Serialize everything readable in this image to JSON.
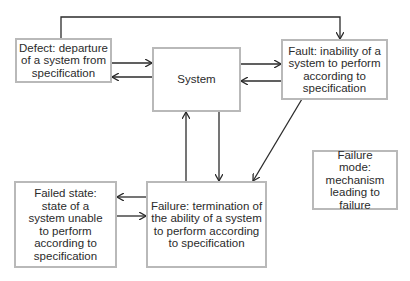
{
  "diagram": {
    "nodes": {
      "defect": {
        "label": "Defect: departure of a system from specification"
      },
      "system": {
        "label": "System"
      },
      "fault": {
        "label": "Fault: inability of a system to perform according to specification"
      },
      "failure": {
        "label": "Failure: termination of the ability of a system to perform according to specification"
      },
      "failed_state": {
        "label": "Failed state: state of a system unable to perform according to specification"
      },
      "failure_mode": {
        "label": "Failure mode: mechanism leading to failure"
      }
    },
    "edges": [
      {
        "from": "defect",
        "to": "fault",
        "route": "over-top"
      },
      {
        "from": "defect",
        "to": "system"
      },
      {
        "from": "system",
        "to": "defect"
      },
      {
        "from": "system",
        "to": "fault"
      },
      {
        "from": "fault",
        "to": "system"
      },
      {
        "from": "system",
        "to": "failure"
      },
      {
        "from": "failure",
        "to": "system"
      },
      {
        "from": "fault",
        "to": "failure"
      },
      {
        "from": "failure",
        "to": "failed_state"
      },
      {
        "from": "failed_state",
        "to": "failure"
      }
    ],
    "colors": {
      "box_border": "#b9b9b9",
      "line": "#2b2b2b",
      "text": "#2b2b2b"
    }
  }
}
